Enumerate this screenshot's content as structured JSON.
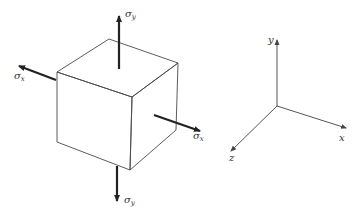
{
  "diagram": {
    "type": "stress-element-with-coordinate-axes",
    "stress_element": {
      "shape": "cube",
      "arrows": [
        {
          "id": "sigma-y-top",
          "direction": "up",
          "label": "σ",
          "subscript": "y"
        },
        {
          "id": "sigma-x-left",
          "direction": "left",
          "label": "σ",
          "subscript": "x"
        },
        {
          "id": "sigma-x-right",
          "direction": "right",
          "label": "σ",
          "subscript": "x"
        },
        {
          "id": "sigma-y-bottom",
          "direction": "down",
          "label": "σ",
          "subscript": "y"
        }
      ]
    },
    "axes": {
      "y_label": "y",
      "x_label": "x",
      "z_label": "z"
    }
  }
}
